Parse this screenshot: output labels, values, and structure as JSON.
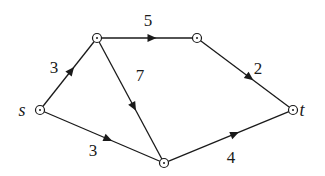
{
  "graph": {
    "type": "directed-weighted-network",
    "nodes": [
      {
        "id": "s",
        "label": "s",
        "x": 40,
        "y": 110,
        "label_x": 22,
        "label_y": 116
      },
      {
        "id": "a",
        "label": "",
        "x": 97,
        "y": 38
      },
      {
        "id": "b",
        "label": "",
        "x": 197,
        "y": 38
      },
      {
        "id": "t",
        "label": "t",
        "x": 293,
        "y": 110,
        "label_x": 302,
        "label_y": 116
      },
      {
        "id": "c",
        "label": "",
        "x": 164,
        "y": 163
      }
    ],
    "edges": [
      {
        "from": "s",
        "to": "a",
        "weight": "3",
        "label_x": 54,
        "label_y": 73
      },
      {
        "from": "a",
        "to": "b",
        "weight": "5",
        "label_x": 148,
        "label_y": 26
      },
      {
        "from": "a",
        "to": "c",
        "weight": "7",
        "label_x": 140,
        "label_y": 81
      },
      {
        "from": "b",
        "to": "t",
        "weight": "2",
        "label_x": 258,
        "label_y": 74
      },
      {
        "from": "s",
        "to": "c",
        "weight": "3",
        "label_x": 93,
        "label_y": 156
      },
      {
        "from": "c",
        "to": "t",
        "weight": "4",
        "label_x": 231,
        "label_y": 163
      }
    ]
  },
  "colors": {
    "stroke": "#1a1a1a",
    "background": "#ffffff"
  }
}
